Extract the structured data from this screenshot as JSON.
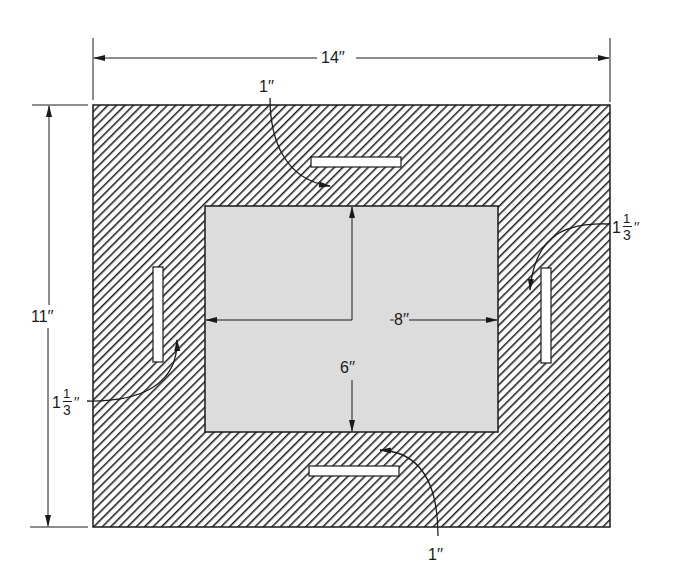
{
  "diagram": {
    "type": "mat-board-dimension-drawing",
    "outer_board": {
      "width_label": "14′′",
      "height_label": "11′′",
      "fill": "hatched"
    },
    "inner_opening": {
      "width_label": "8′′",
      "height_label": "6′′",
      "fill": "#dcdcdc"
    },
    "slots": {
      "top": {
        "label": "1′′"
      },
      "bottom": {
        "label": "1′′"
      },
      "left": {
        "whole": "1",
        "numerator": "1",
        "denominator": "3",
        "mark": "′′"
      },
      "right": {
        "whole": "1",
        "numerator": "1",
        "denominator": "3",
        "mark": "′′"
      }
    },
    "colors": {
      "line": "#1a1a1a",
      "hatch": "#1a1a1a",
      "inner_fill": "#dcdcdc",
      "background": "#ffffff",
      "slot_fill": "#ffffff"
    }
  }
}
